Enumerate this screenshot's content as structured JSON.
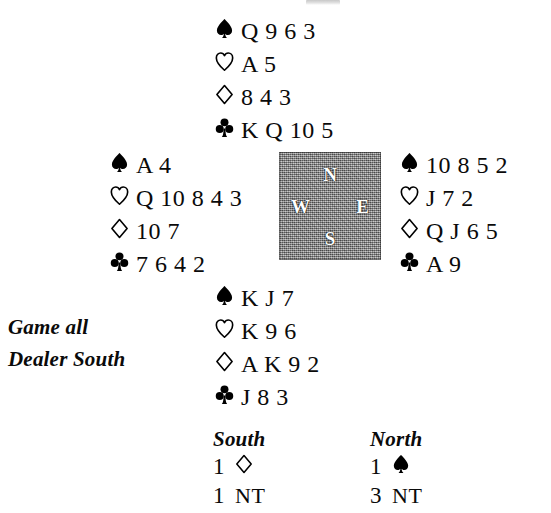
{
  "diagram": {
    "type": "bridge-hand-deal",
    "conditions": {
      "vulnerability": "Game all",
      "dealer": "Dealer South"
    },
    "compass": {
      "north": "N",
      "west": "W",
      "east": "E",
      "south": "S",
      "background_color": "#8d8d8d",
      "label_color": "#ffffff"
    },
    "suit_order": [
      "spades",
      "hearts",
      "diamonds",
      "clubs"
    ],
    "suit_symbols": {
      "spades": "♠",
      "hearts": "♡",
      "diamonds": "♢",
      "clubs": "♣"
    },
    "hands": {
      "north": {
        "label": "North",
        "spades": "Q 9 6 3",
        "hearts": "A 5",
        "diamonds": "8 4 3",
        "clubs": "K Q 10 5"
      },
      "west": {
        "label": "West",
        "spades": "A 4",
        "hearts": "Q 10 8 4 3",
        "diamonds": "10 7",
        "clubs": "7 6 4 2"
      },
      "east": {
        "label": "East",
        "spades": "10 8 5 2",
        "hearts": "J 7 2",
        "diamonds": "Q J 6 5",
        "clubs": "A 9"
      },
      "south": {
        "label": "South",
        "spades": "K J 7",
        "hearts": "K 9 6",
        "diamonds": "A K 9 2",
        "clubs": "J 8 3"
      }
    },
    "auction": {
      "columns": [
        {
          "header": "South",
          "bids": [
            {
              "level": "1",
              "denomination": "diamonds",
              "text": ""
            },
            {
              "level": "1",
              "denomination": "notrump",
              "text": "NT"
            }
          ]
        },
        {
          "header": "North",
          "bids": [
            {
              "level": "1",
              "denomination": "spades",
              "text": ""
            },
            {
              "level": "3",
              "denomination": "notrump",
              "text": "NT"
            }
          ]
        }
      ]
    }
  }
}
